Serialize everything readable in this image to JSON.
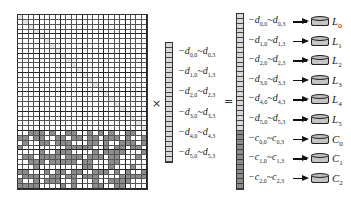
{
  "diagram": {
    "matrix": {
      "rows": 36,
      "cols": 24,
      "block_size": 4,
      "identity_rows": 24,
      "parity_rows": 12,
      "colors": {
        "line": "#555555",
        "thick_line": "#222222",
        "diag": "#e4e4e4",
        "shade": "#8c8c8c",
        "white": "#ffffff"
      }
    },
    "operators": {
      "multiply": "×",
      "equals": "="
    },
    "data_vector": {
      "cells": 24,
      "labels": [
        {
          "base": "−d",
          "s1": "0,0",
          "base2": "d",
          "s2": "0,3"
        },
        {
          "base": "−d",
          "s1": "1,0",
          "base2": "d",
          "s2": "1,3"
        },
        {
          "base": "−d",
          "s1": "2,0",
          "base2": "d",
          "s2": "2,3"
        },
        {
          "base": "−d",
          "s1": "3,0",
          "base2": "d",
          "s2": "3,3"
        },
        {
          "base": "−d",
          "s1": "4,0",
          "base2": "d",
          "s2": "4,3"
        },
        {
          "base": "−d",
          "s1": "5,0",
          "base2": "d",
          "s2": "5,3"
        }
      ]
    },
    "result_vector": {
      "cells": 36,
      "light_cells": 24,
      "rows": [
        {
          "base": "−d",
          "s1": "0,0",
          "base2": "d",
          "s2": "0,3",
          "disk": "L",
          "disk_sub": "0"
        },
        {
          "base": "−d",
          "s1": "1,0",
          "base2": "d",
          "s2": "1,3",
          "disk": "L",
          "disk_sub": "1"
        },
        {
          "base": "−d",
          "s1": "2,0",
          "base2": "d",
          "s2": "2,3",
          "disk": "L",
          "disk_sub": "2"
        },
        {
          "base": "−d",
          "s1": "3,0",
          "base2": "d",
          "s2": "3,3",
          "disk": "L",
          "disk_sub": "3"
        },
        {
          "base": "−d",
          "s1": "4,0",
          "base2": "d",
          "s2": "4,3",
          "disk": "L",
          "disk_sub": "4"
        },
        {
          "base": "−d",
          "s1": "5,0",
          "base2": "d",
          "s2": "5,3",
          "disk": "L",
          "disk_sub": "5"
        },
        {
          "base": "−c",
          "s1": "0,0",
          "base2": "c",
          "s2": "0,3",
          "disk": "C",
          "disk_sub": "0"
        },
        {
          "base": "−c",
          "s1": "1,0",
          "base2": "c",
          "s2": "1,3",
          "disk": "C",
          "disk_sub": "1"
        },
        {
          "base": "−c",
          "s1": "2,0",
          "base2": "c",
          "s2": "2,3",
          "disk": "C",
          "disk_sub": "2"
        }
      ]
    },
    "tilde": "~"
  }
}
